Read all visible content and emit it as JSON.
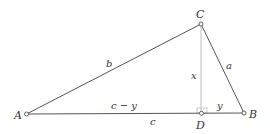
{
  "diagram": {
    "type": "triangle-with-altitude",
    "vertices": {
      "A": {
        "label": "A"
      },
      "B": {
        "label": "B"
      },
      "C": {
        "label": "C"
      },
      "D": {
        "label": "D"
      }
    },
    "side_labels": {
      "b": "b",
      "a": "a",
      "x": "x",
      "c_minus_y": "c − y",
      "y": "y",
      "c": "c"
    },
    "colors": {
      "edge": "#555555",
      "altitude": "#bbbbbb",
      "right_angle_marker": "#bbbbbb",
      "point_fill": "#ffffff",
      "text": "#333333"
    }
  }
}
